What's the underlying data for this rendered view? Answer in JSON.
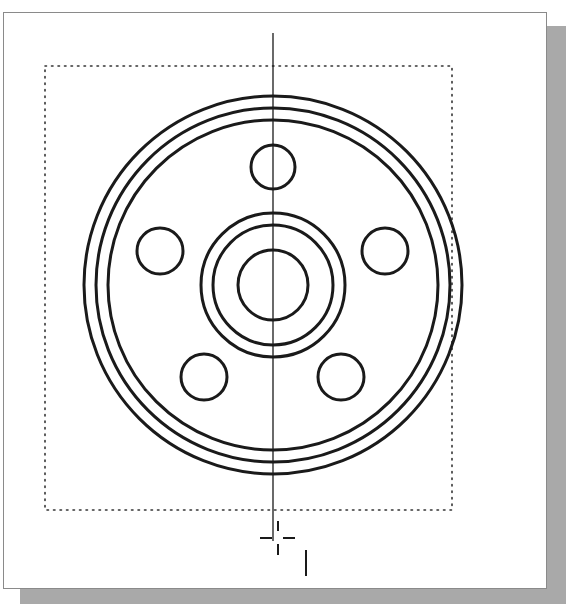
{
  "canvas": {
    "width": 571,
    "height": 610,
    "background": "#ffffff"
  },
  "viewport": {
    "border_color": "#8a8a8a",
    "shadow_color": "#a9a9a9"
  },
  "drawing": {
    "description": "CAD top view of a circular flange with five bolt holes, centered hub and vertical centerline",
    "line_color": "#1a1a1a",
    "limits_box": {
      "x": 45,
      "y": 66,
      "width": 407,
      "height": 444,
      "style": "dotted"
    },
    "centerline": {
      "x": 273,
      "y1": 33,
      "y2": 541
    },
    "center": {
      "x": 273,
      "y": 285
    },
    "outer_rings": [
      {
        "r": 189
      },
      {
        "r": 177
      },
      {
        "r": 165
      }
    ],
    "hub_rings": [
      {
        "r": 72
      },
      {
        "r": 60
      },
      {
        "r": 35
      }
    ],
    "bolt_holes": [
      {
        "cx": 273,
        "cy": 167,
        "r": 22
      },
      {
        "cx": 160,
        "cy": 251,
        "r": 23
      },
      {
        "cx": 385,
        "cy": 251,
        "r": 23
      },
      {
        "cx": 204,
        "cy": 377,
        "r": 23
      },
      {
        "cx": 341,
        "cy": 377,
        "r": 23
      }
    ],
    "cursor": {
      "x": 274,
      "y": 538
    },
    "cursor_mark": {
      "x": 306,
      "y1": 550,
      "y2": 576
    }
  }
}
